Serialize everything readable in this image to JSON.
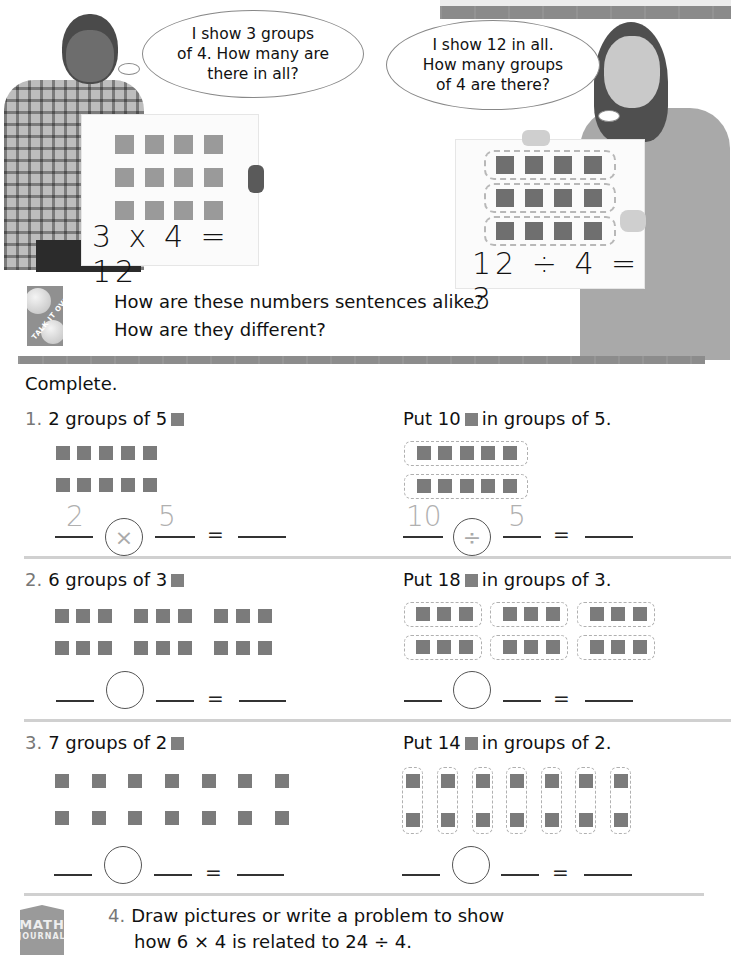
{
  "header": {
    "band_color": "#8a8a8a"
  },
  "boy": {
    "speech": [
      "I show 3 groups",
      "of 4. How many are",
      "there in all?"
    ],
    "board": {
      "rows": 3,
      "cols": 4,
      "equation": "3 x 4 = 12"
    }
  },
  "girl": {
    "speech": [
      "I show 12 in all.",
      "How many groups",
      "of 4 are there?"
    ],
    "board": {
      "rows": 3,
      "cols": 4,
      "equation": "12 ÷ 4 = 3"
    }
  },
  "talk_it_over": {
    "icon_label": "TALK IT OVER",
    "line1": "How are these numbers sentences alike?",
    "line2": "How are they different?"
  },
  "instructions": "Complete.",
  "exercises": [
    {
      "number": "1.",
      "left_label": "2 groups of 5",
      "left_rows": 2,
      "left_groups": 1,
      "left_group_size": 5,
      "left_answer": {
        "a": "2",
        "op": "×",
        "b": "5",
        "result": ""
      },
      "right_label_pre": "Put 10",
      "right_label_post": "in groups of 5.",
      "right_groups": 2,
      "right_group_size": 5,
      "right_answer": {
        "a": "10",
        "op": "÷",
        "b": "5",
        "result": ""
      }
    },
    {
      "number": "2.",
      "left_label": "6 groups of 3",
      "left_answer": {
        "a": "",
        "op": "",
        "b": "",
        "result": ""
      },
      "right_label_pre": "Put 18",
      "right_label_post": "in groups of 3.",
      "right_answer": {
        "a": "",
        "op": "",
        "b": "",
        "result": ""
      }
    },
    {
      "number": "3.",
      "left_label": "7 groups of 2",
      "left_answer": {
        "a": "",
        "op": "",
        "b": "",
        "result": ""
      },
      "right_label_pre": "Put 14",
      "right_label_post": "in groups of 2.",
      "right_answer": {
        "a": "",
        "op": "",
        "b": "",
        "result": ""
      }
    }
  ],
  "equals": "=",
  "journal": {
    "icon_top": "MATH",
    "icon_bottom": "JOURNAL",
    "number": "4.",
    "line1": "Draw pictures or write a problem to show",
    "line2": "how 6 × 4 is related to 24 ÷ 4."
  }
}
